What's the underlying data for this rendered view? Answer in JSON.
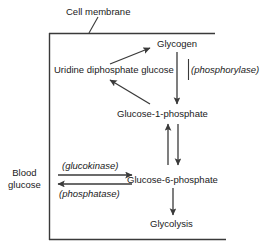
{
  "diagram": {
    "title_label": "Cell membrane",
    "nodes": [
      {
        "id": "glycogen",
        "label": "Glycogen"
      },
      {
        "id": "udp_glucose",
        "label": "Uridine diphosphate glucose"
      },
      {
        "id": "glucose_1_phosphate",
        "label": "Glucose-1-phosphate"
      },
      {
        "id": "glucose_6_phosphate",
        "label": "Glucose-6-phosphate"
      },
      {
        "id": "glycolysis",
        "label": "Glycolysis"
      },
      {
        "id": "blood_glucose_line1",
        "label": "Blood"
      },
      {
        "id": "blood_glucose_line2",
        "label": "glucose"
      }
    ],
    "enzymes": [
      {
        "id": "phosphorylase",
        "label": "(phosphorylase)"
      },
      {
        "id": "glucokinase",
        "label": "(glucokinase)"
      },
      {
        "id": "phosphatase",
        "label": "(phosphatase)"
      }
    ],
    "colors": {
      "stroke": "#3a3a3a",
      "text": "#1a1a1a",
      "background": "#ffffff"
    }
  }
}
